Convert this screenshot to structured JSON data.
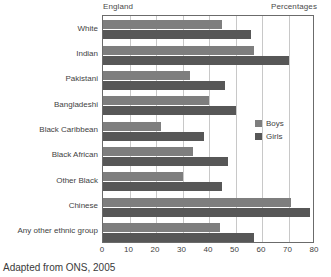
{
  "header": {
    "region_label": "England",
    "units_label": "Percentages"
  },
  "source_note": "Adapted from ONS, 2005",
  "legend": {
    "position": "inside-right",
    "entries": [
      {
        "label": "Boys",
        "color": "#7e7e7e"
      },
      {
        "label": "Girls",
        "color": "#575757"
      }
    ]
  },
  "axis": {
    "x_ticks": [
      "0",
      "10",
      "20",
      "30",
      "40",
      "50",
      "60",
      "70",
      "80"
    ]
  },
  "chart_data": {
    "type": "bar",
    "orientation": "horizontal",
    "title": "",
    "subtitle": "",
    "xlabel": "Percentages",
    "ylabel": "",
    "xlim": [
      0,
      80
    ],
    "xticks": [
      0,
      10,
      20,
      30,
      40,
      50,
      60,
      70,
      80
    ],
    "grid": true,
    "grid_axis": "x",
    "legend_position": "inside-right",
    "annotations": [
      "England",
      "Percentages",
      "Adapted from ONS, 2005"
    ],
    "categories": [
      "White",
      "Indian",
      "Pakistani",
      "Bangladeshi",
      "Black Caribbean",
      "Black African",
      "Other Black",
      "Chinese",
      "Any other ethnic group"
    ],
    "series": [
      {
        "name": "Boys",
        "color": "#7e7e7e",
        "values": [
          45,
          57,
          33,
          40,
          22,
          34,
          30,
          71,
          44
        ]
      },
      {
        "name": "Girls",
        "color": "#575757",
        "values": [
          56,
          70,
          46,
          50,
          38,
          47,
          45,
          78,
          57
        ]
      }
    ]
  }
}
